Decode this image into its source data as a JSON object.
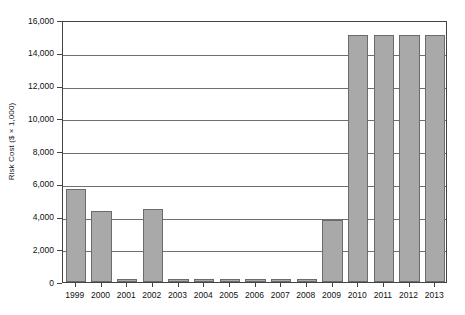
{
  "chart_data": {
    "type": "bar",
    "title": "",
    "xlabel": "",
    "ylabel": "Risk Cost ($ × 1,000)",
    "ylim": [
      0,
      16000
    ],
    "ytick_labels": [
      "0",
      "2,000",
      "4,000",
      "6,000",
      "8,000",
      "10,000",
      "12,000",
      "14,000",
      "16,000"
    ],
    "ytick_values": [
      0,
      2000,
      4000,
      6000,
      8000,
      10000,
      12000,
      14000,
      16000
    ],
    "grid": true,
    "grid_axis": "y",
    "legend": "none",
    "bar_color": "#a9a9a9",
    "bar_edge_color": "#6b6b6b",
    "categories": [
      "1999",
      "2000",
      "2001",
      "2002",
      "2003",
      "2004",
      "2005",
      "2006",
      "2007",
      "2008",
      "2009",
      "2010",
      "2011",
      "2012",
      "2013"
    ],
    "values": [
      5700,
      4350,
      200,
      4450,
      200,
      200,
      200,
      200,
      200,
      200,
      3800,
      15100,
      15100,
      15100,
      15100
    ]
  }
}
